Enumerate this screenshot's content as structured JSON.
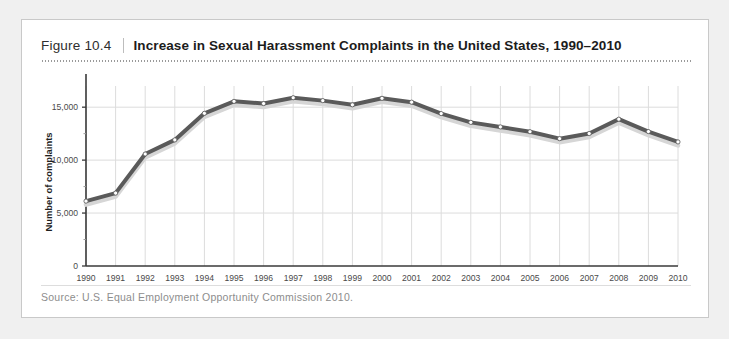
{
  "figure": {
    "label": "Figure 10.4",
    "title": "Increase in Sexual Harassment Complaints in the United States, 1990–2010",
    "source": "Source: U.S. Equal Employment Opportunity Commission 2010."
  },
  "colors": {
    "card_background": "#ffffff",
    "page_background": "#f0f0f0",
    "card_border": "#c9c9c9",
    "line": "#5a5a5a",
    "line_shadow": "#d6d6d6",
    "marker_fill": "#ffffff",
    "marker_stroke": "#5a5a5a",
    "grid": "#dcdcdc",
    "axis": "#3a3a3a",
    "tick_label": "#4a4a4a",
    "title": "#1c1c1c",
    "source_text": "#8d8d8d"
  },
  "chart_data": {
    "type": "line",
    "title": "Increase in Sexual Harassment Complaints in the United States, 1990–2010",
    "xlabel": "",
    "ylabel": "Number of complaints",
    "x": [
      1990,
      1991,
      1992,
      1993,
      1994,
      1995,
      1996,
      1997,
      1998,
      1999,
      2000,
      2001,
      2002,
      2003,
      2004,
      2005,
      2006,
      2007,
      2008,
      2009,
      2010
    ],
    "categories": [
      "1990",
      "1991",
      "1992",
      "1993",
      "1994",
      "1995",
      "1996",
      "1997",
      "1998",
      "1999",
      "2000",
      "2001",
      "2002",
      "2003",
      "2004",
      "2005",
      "2006",
      "2007",
      "2008",
      "2009",
      "2010"
    ],
    "values": [
      6127,
      6883,
      10577,
      11908,
      14420,
      15549,
      15342,
      15889,
      15618,
      15222,
      15836,
      15475,
      14396,
      13566,
      13136,
      12679,
      12025,
      12510,
      13867,
      12696,
      11717
    ],
    "series": [
      {
        "name": "Number of complaints",
        "values": [
          6127,
          6883,
          10577,
          11908,
          14420,
          15549,
          15342,
          15889,
          15618,
          15222,
          15836,
          15475,
          14396,
          13566,
          13136,
          12679,
          12025,
          12510,
          13867,
          12696,
          11717
        ]
      }
    ],
    "ylim": [
      0,
      17000
    ],
    "xlim": [
      1990,
      2010
    ],
    "yticks": [
      0,
      5000,
      10000,
      15000
    ],
    "ytick_labels": [
      "0",
      "5,000",
      "10,000",
      "15,000"
    ],
    "yticks_minor": [
      2500,
      7500,
      12500
    ],
    "grid": "vertical-and-horizontal",
    "legend": "none",
    "markers": "circle"
  }
}
